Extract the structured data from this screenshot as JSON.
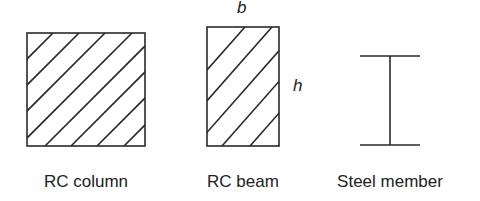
{
  "diagram": {
    "colors": {
      "stroke": "#2a2a2a",
      "background": "#ffffff",
      "text": "#222222"
    },
    "sections": [
      {
        "id": "rc-column",
        "label": "RC column",
        "shape": "rectangle",
        "fill": "diagonal-hatch"
      },
      {
        "id": "rc-beam",
        "label": "RC beam",
        "shape": "rectangle",
        "fill": "diagonal-hatch",
        "dimensions": {
          "width": "b",
          "height": "h"
        }
      },
      {
        "id": "steel-member",
        "label": "Steel member",
        "shape": "I-section",
        "fill": "none"
      }
    ]
  }
}
